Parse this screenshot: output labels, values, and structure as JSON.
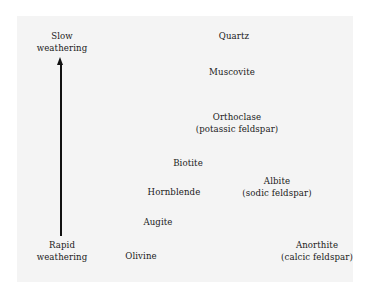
{
  "diagram": {
    "axis": {
      "top_label_line1": "Slow",
      "top_label_line2": "weathering",
      "bottom_label_line1": "Rapid",
      "bottom_label_line2": "weathering",
      "direction": "upward arrow from rapid to slow weathering"
    },
    "minerals": [
      {
        "name": "Quartz",
        "subtitle": null
      },
      {
        "name": "Muscovite",
        "subtitle": null
      },
      {
        "name": "Orthoclase",
        "subtitle": "(potassic feldspar)"
      },
      {
        "name": "Biotite",
        "subtitle": null
      },
      {
        "name": "Hornblende",
        "subtitle": null
      },
      {
        "name": "Albite",
        "subtitle": "(sodic feldspar)"
      },
      {
        "name": "Augite",
        "subtitle": null
      },
      {
        "name": "Olivine",
        "subtitle": null
      },
      {
        "name": "Anorthite",
        "subtitle": "(calcic feldspar)"
      }
    ],
    "colors": {
      "background": "#ffffff",
      "panel": "#f4f4f4",
      "text": "#1a1a1a",
      "arrow": "#111111"
    }
  }
}
